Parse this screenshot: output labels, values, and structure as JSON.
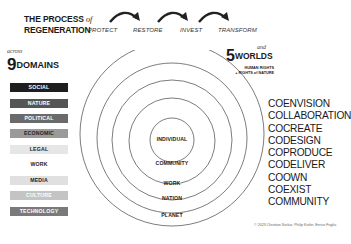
{
  "header": {
    "title_line1": "THE PROCESS",
    "title_of": "of",
    "title_line2": "REGENERATION",
    "steps": [
      "PROTECT",
      "RESTORE",
      "INVEST",
      "TRANSFORM"
    ]
  },
  "domains": {
    "prefix": "across",
    "count": "9",
    "label": "DOMAINS",
    "items": [
      {
        "label": "SOCIAL",
        "bg": "#1e1e1e",
        "fg": "#ffffff"
      },
      {
        "label": "NATURE",
        "bg": "#555555",
        "fg": "#ffffff"
      },
      {
        "label": "POLITICAL",
        "bg": "#6a6a6a",
        "fg": "#ffffff"
      },
      {
        "label": "ECONOMIC",
        "bg": "#9a9a9a",
        "fg": "#222222"
      },
      {
        "label": "LEGAL",
        "bg": "#e6e6e6",
        "fg": "#222222"
      },
      {
        "label": "WORK",
        "bg": "#ffffff",
        "fg": "#222222"
      },
      {
        "label": "MEDIA",
        "bg": "#e0e0e0",
        "fg": "#222222"
      },
      {
        "label": "CULTURE",
        "bg": "#c4c4c4",
        "fg": "#ffffff"
      },
      {
        "label": "TECHNOLOGY",
        "bg": "#7a7a7a",
        "fg": "#ffffff"
      }
    ]
  },
  "worlds": {
    "prefix": "and",
    "count": "5",
    "label": "WORLDS",
    "sub_line1": "HUMAN RIGHTS",
    "sub_line2": "+ RIGHTS of NATURE",
    "rings": [
      "INDIVIDUAL",
      "COMMUNITY",
      "WORK",
      "NATION",
      "PLANET"
    ]
  },
  "verbs": [
    "COENVISION",
    "COLLABORATION",
    "COCREATE",
    "CODESIGN",
    "COPRODUCE",
    "CODELIVER",
    "COOWN",
    "COEXIST",
    "COMMUNITY"
  ],
  "footer": {
    "copyright": "© 2023 Christian Sarkar, Philip Kotler, Enrico Foglia"
  }
}
